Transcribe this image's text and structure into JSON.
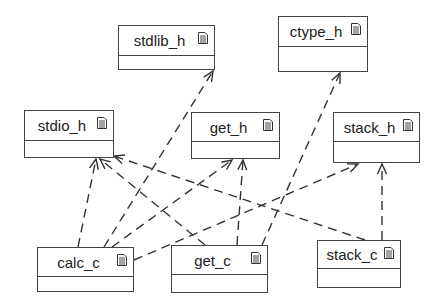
{
  "diagram": {
    "type": "uml-file-dependency",
    "line_color": "#333333",
    "node_border_color": "#444444",
    "nodes": [
      {
        "id": "stdlib_h",
        "label": "stdlib_h",
        "icon": "document-icon",
        "x": 118,
        "y": 25,
        "w": 97,
        "h": 45,
        "head_h": 29
      },
      {
        "id": "ctype_h",
        "label": "ctype_h",
        "icon": "document-icon",
        "x": 278,
        "y": 16,
        "w": 90,
        "h": 56,
        "head_h": 29
      },
      {
        "id": "stdio_h",
        "label": "stdio_h",
        "icon": "document-icon",
        "x": 24,
        "y": 110,
        "w": 90,
        "h": 48,
        "head_h": 29
      },
      {
        "id": "get_h",
        "label": "get_h",
        "icon": "document-icon",
        "x": 191,
        "y": 112,
        "w": 89,
        "h": 47,
        "head_h": 28
      },
      {
        "id": "stack_h",
        "label": "stack_h",
        "icon": "document-icon",
        "x": 333,
        "y": 112,
        "w": 87,
        "h": 51,
        "head_h": 28
      },
      {
        "id": "calc_c",
        "label": "calc_c",
        "icon": "document-icon",
        "x": 37,
        "y": 247,
        "w": 97,
        "h": 45,
        "head_h": 28
      },
      {
        "id": "get_c",
        "label": "get_c",
        "icon": "document-icon",
        "x": 171,
        "y": 245,
        "w": 97,
        "h": 48,
        "head_h": 28
      },
      {
        "id": "stack_c",
        "label": "stack_c",
        "icon": "document-icon",
        "x": 317,
        "y": 240,
        "w": 84,
        "h": 48,
        "head_h": 27
      }
    ],
    "edges": [
      {
        "from": "calc_c",
        "to": "stdlib_h",
        "style": "dashed",
        "arrow": "open",
        "x1": 104,
        "y1": 247,
        "x2": 213,
        "y2": 71
      },
      {
        "from": "calc_c",
        "to": "stdio_h",
        "style": "dashed",
        "arrow": "open",
        "x1": 78,
        "y1": 247,
        "x2": 96,
        "y2": 159
      },
      {
        "from": "calc_c",
        "to": "get_h",
        "style": "dashed",
        "arrow": "open",
        "x1": 112,
        "y1": 247,
        "x2": 232,
        "y2": 160
      },
      {
        "from": "calc_c",
        "to": "stack_h",
        "style": "dashed",
        "arrow": "open",
        "x1": 134,
        "y1": 260,
        "x2": 358,
        "y2": 164
      },
      {
        "from": "get_c",
        "to": "stdio_h",
        "style": "dashed",
        "arrow": "open",
        "x1": 205,
        "y1": 245,
        "x2": 100,
        "y2": 159
      },
      {
        "from": "get_c",
        "to": "get_h",
        "style": "dashed",
        "arrow": "open",
        "x1": 237,
        "y1": 245,
        "x2": 243,
        "y2": 160
      },
      {
        "from": "get_c",
        "to": "ctype_h",
        "style": "dashed",
        "arrow": "open",
        "x1": 262,
        "y1": 245,
        "x2": 340,
        "y2": 73
      },
      {
        "from": "stack_c",
        "to": "stdio_h",
        "style": "dashed",
        "arrow": "open",
        "x1": 365,
        "y1": 240,
        "x2": 114,
        "y2": 156
      },
      {
        "from": "stack_c",
        "to": "stack_h",
        "style": "dashed",
        "arrow": "open",
        "x1": 382,
        "y1": 240,
        "x2": 382,
        "y2": 164
      }
    ]
  }
}
